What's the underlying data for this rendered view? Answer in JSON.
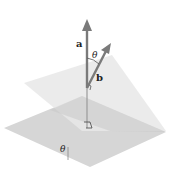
{
  "diagram": {
    "labels": {
      "vector_a": "a",
      "vector_b": "b",
      "angle_between_normals": "θ",
      "angle_between_planes": "θ"
    },
    "colors": {
      "background": "#ffffff",
      "upper_plane": "#e6e6e6",
      "lower_plane": "#d2d2d2",
      "overlap": "#c4c4c4",
      "arrow": "#7a7a7a",
      "text": "#222222"
    },
    "annotations": {
      "right_angle_markers": 2
    }
  }
}
